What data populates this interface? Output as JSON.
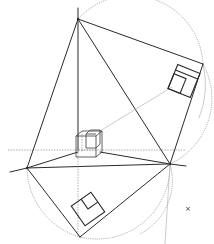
{
  "diagram": {
    "type": "perspective-construction",
    "colors": {
      "line": "#2a2a2a",
      "construction": "#9a9a9a",
      "background": "#ffffff"
    },
    "elements": {
      "station_point_top": {
        "x": 78,
        "y": 19
      },
      "vanishing_point_left": {
        "x": 27,
        "y": 168
      },
      "vanishing_point_right": {
        "x": 170,
        "y": 164
      },
      "bottom_point": {
        "x": 80,
        "y": 237
      },
      "right_top_point": {
        "x": 203,
        "y": 64
      },
      "cube_center": {
        "x": 89,
        "y": 145
      },
      "square_top_right_center": {
        "x": 184,
        "y": 81
      },
      "square_bottom_left_center": {
        "x": 88,
        "y": 209
      },
      "marker": {
        "x": 188,
        "y": 208,
        "glyph": "×"
      }
    },
    "marker_label": "×"
  }
}
